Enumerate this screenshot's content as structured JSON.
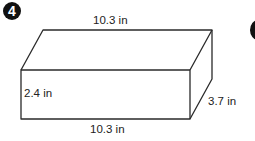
{
  "problem": {
    "number": "4",
    "shape": "rectangular prism",
    "labels": {
      "top_length": "10.3 in",
      "height": "2.4 in",
      "depth": "3.7 in",
      "bottom_length": "10.3 in"
    }
  },
  "colors": {
    "line": "#2a2a2a",
    "badge": "#111111"
  }
}
